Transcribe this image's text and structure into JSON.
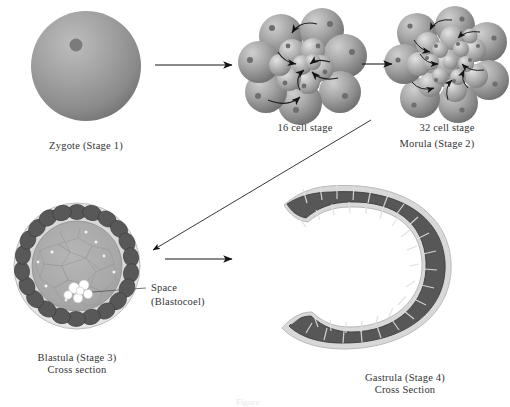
{
  "figure": {
    "background_color": "#ffffff",
    "text_color": "#333333",
    "cell_dark_color": "#4f4f4f",
    "cell_mid_color": "#8f8f8f",
    "cell_light_color": "#d6d6d6",
    "blastocoel_color": "#ffffff",
    "arrow_color": "#1a1a1a"
  },
  "stages": {
    "zygote": {
      "label": "Zygote (Stage 1)",
      "stage_number": 1,
      "cell_count": 1
    },
    "sixteen_cell": {
      "label": "16 cell stage",
      "cell_count": 16
    },
    "thirty_two_cell": {
      "label": "32 cell stage",
      "cell_count": 32
    },
    "morula": {
      "label": "Morula (Stage 2)",
      "stage_number": 2
    },
    "blastula": {
      "label_line1": "Blastula (Stage 3)",
      "label_line2": "Cross section",
      "stage_number": 3,
      "callout_line1": "Space",
      "callout_line2": "(Blastocoel)"
    },
    "gastrula": {
      "label_line1": "Gastrula (Stage 4)",
      "label_line2": "Cross Section",
      "stage_number": 4
    }
  },
  "arrows": [
    {
      "name": "zygote-to-16cell",
      "direction": "right"
    },
    {
      "name": "16cell-to-32cell",
      "direction": "right"
    },
    {
      "name": "morula-to-blastula",
      "direction": "diagonal-down-left"
    },
    {
      "name": "blastula-to-gastrula",
      "direction": "right"
    }
  ],
  "bottom_fragment": "Figure"
}
